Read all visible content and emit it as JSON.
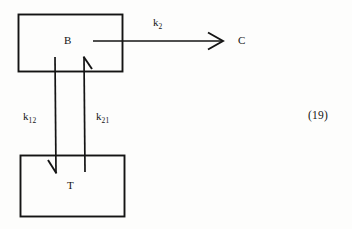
{
  "figure": {
    "kind": "compartment-kinetics-diagram",
    "equation_number": "(19)",
    "background_color": "#fdfdfc",
    "ink_color": "#141414"
  },
  "compartments": [
    {
      "id": "B",
      "label": "B",
      "x": 18,
      "y": 14,
      "width": 104,
      "height": 57
    },
    {
      "id": "T",
      "label": "T",
      "x": 20,
      "y": 155,
      "width": 104,
      "height": 61
    }
  ],
  "species": [
    {
      "id": "C",
      "label": "C"
    }
  ],
  "rate_constants": [
    {
      "id": "k2",
      "base": "k",
      "sub": "2",
      "label": "k2",
      "from": "B",
      "to": "C"
    },
    {
      "id": "k12",
      "base": "k",
      "sub": "12",
      "label": "k12",
      "from": "B",
      "to": "T"
    },
    {
      "id": "k21",
      "base": "k",
      "sub": "21",
      "label": "k21",
      "from": "T",
      "to": "B"
    }
  ],
  "arrows": [
    {
      "id": "arrow-b-to-c",
      "direction": "right",
      "from": "B",
      "to": "C",
      "rate": "k2"
    },
    {
      "id": "arrow-b-to-t",
      "direction": "down",
      "from": "B",
      "to": "T",
      "rate": "k12"
    },
    {
      "id": "arrow-t-to-b",
      "direction": "up",
      "from": "T",
      "to": "B",
      "rate": "k21"
    }
  ]
}
